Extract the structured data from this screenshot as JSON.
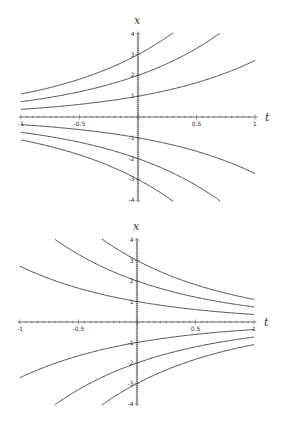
{
  "chart_data": [
    {
      "type": "line",
      "title": "",
      "xlabel": "t",
      "ylabel": "x",
      "xlim": [
        -1,
        1
      ],
      "ylim": [
        -4,
        4
      ],
      "xticks": [
        -1,
        -0.5,
        0.5,
        1
      ],
      "xtick_labels": [
        "-1",
        "-0.5",
        "0.5",
        "1"
      ],
      "yticks": [
        -4,
        -3,
        -2,
        -1,
        1,
        2,
        3,
        4
      ],
      "ytick_labels": [
        "-4",
        "-3",
        "-2",
        "-1",
        "1",
        "2",
        "3",
        "4"
      ],
      "grid": false,
      "legend": "none",
      "function": "x = C*exp(t)",
      "series": [
        {
          "name": "C=3",
          "C": 3,
          "sign": 1
        },
        {
          "name": "C=2",
          "C": 2,
          "sign": 1
        },
        {
          "name": "C=1",
          "C": 1,
          "sign": 1
        },
        {
          "name": "C=-1",
          "C": -1,
          "sign": 1
        },
        {
          "name": "C=-2",
          "C": -2,
          "sign": 1
        },
        {
          "name": "C=-3",
          "C": -3,
          "sign": 1
        }
      ],
      "layout": {
        "x0": 138,
        "y0": 117,
        "px_per_t": 117,
        "px_per_x": 20.8,
        "top": 0
      }
    },
    {
      "type": "line",
      "title": "",
      "xlabel": "t",
      "ylabel": "x",
      "xlim": [
        -1,
        1
      ],
      "ylim": [
        -4,
        4
      ],
      "xticks": [
        -1,
        -0.5,
        0.5,
        1
      ],
      "xtick_labels": [
        "-1",
        "-0.5",
        "0.5",
        "1"
      ],
      "yticks": [
        -4,
        -3,
        -2,
        -1,
        1,
        2,
        3,
        4
      ],
      "ytick_labels": [
        "-4",
        "-3",
        "-2",
        "-1",
        "1",
        "2",
        "3",
        "4"
      ],
      "grid": false,
      "legend": "none",
      "function": "x = C*exp(-t)",
      "series": [
        {
          "name": "C=3",
          "C": 3,
          "sign": -1
        },
        {
          "name": "C=2",
          "C": 2,
          "sign": -1
        },
        {
          "name": "C=1",
          "C": 1,
          "sign": -1
        },
        {
          "name": "C=-1",
          "C": -1,
          "sign": -1
        },
        {
          "name": "C=-2",
          "C": -2,
          "sign": -1
        },
        {
          "name": "C=-3",
          "C": -3,
          "sign": -1
        }
      ],
      "layout": {
        "x0": 137,
        "y0": 110,
        "px_per_t": 117,
        "px_per_x": 20.5,
        "top": 212
      }
    }
  ],
  "style": {
    "line_color": "#3a3a3a",
    "axis_color": "#444444",
    "background": "#ffffff"
  }
}
